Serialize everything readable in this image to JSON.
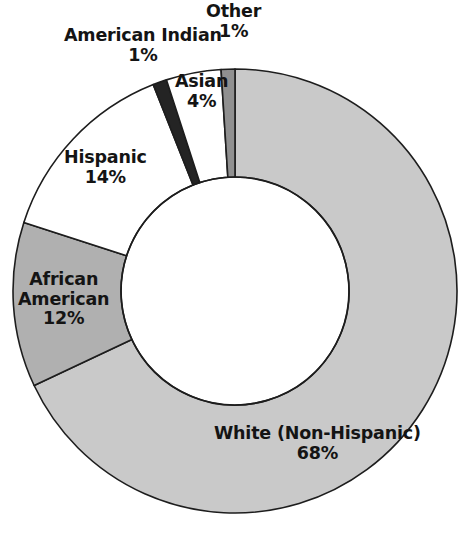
{
  "chart_data": {
    "type": "pie",
    "variant": "donut",
    "title": "",
    "xlabel": "",
    "ylabel": "",
    "legend": "none",
    "grid": false,
    "value_unit": "%",
    "categories": [
      "White (Non-Hispanic)",
      "African American",
      "Hispanic",
      "American Indian",
      "Asian",
      "Other"
    ],
    "values": [
      68,
      12,
      14,
      1,
      4,
      1
    ],
    "slices": [
      {
        "label": "White (Non-Hispanic)",
        "value": 68,
        "value_text": "68%",
        "color": "#c9c9c9",
        "start_angle": 0,
        "end_angle": 244.8
      },
      {
        "label": "African American",
        "value": 12,
        "value_text": "12%",
        "color": "#b0b0b0",
        "start_angle": 244.8,
        "end_angle": 288.0
      },
      {
        "label": "Hispanic",
        "value": 14,
        "value_text": "14%",
        "color": "#ffffff",
        "start_angle": 288.0,
        "end_angle": 338.4
      },
      {
        "label": "American Indian",
        "value": 1,
        "value_text": "1%",
        "color": "#242424",
        "start_angle": 338.4,
        "end_angle": 342.0
      },
      {
        "label": "Asian",
        "value": 4,
        "value_text": "4%",
        "color": "#ffffff",
        "start_angle": 342.0,
        "end_angle": 356.4
      },
      {
        "label": "Other",
        "value": 1,
        "value_text": "1%",
        "color": "#909090",
        "start_angle": 356.4,
        "end_angle": 360.0
      }
    ]
  },
  "labels": {
    "other": {
      "name": "Other",
      "value": "1%"
    },
    "american_indian": {
      "name": "American Indian",
      "value": "1%"
    },
    "asian": {
      "name": "Asian",
      "value": "4%"
    },
    "hispanic": {
      "name": "Hispanic",
      "value": "14%"
    },
    "african_american_line1": "African",
    "african_american_line2": "American",
    "african_american_value": "12%",
    "white": {
      "name": "White (Non-Hispanic)",
      "value": "68%"
    }
  },
  "colors": {
    "background": "#ffffff",
    "outline": "#1d1d1d",
    "text": "#141414",
    "white_non_hispanic": "#c9c9c9",
    "african_american": "#b0b0b0",
    "hispanic": "#ffffff",
    "american_indian": "#242424",
    "asian": "#ffffff",
    "other": "#909090"
  }
}
